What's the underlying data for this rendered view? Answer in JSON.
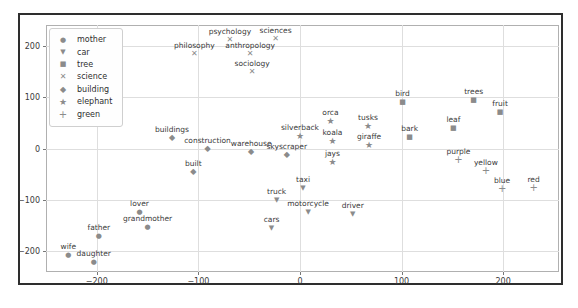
{
  "chart_data": {
    "type": "scatter",
    "title": "",
    "xlabel": "",
    "ylabel": "",
    "xlim": [
      -250,
      255
    ],
    "ylim": [
      -240,
      240
    ],
    "xticks": [
      -200,
      -100,
      0,
      100,
      200
    ],
    "yticks": [
      -200,
      -100,
      0,
      100,
      200
    ],
    "grid": true,
    "legend_position": "upper-left",
    "colors": {
      "marker": "#8b8b8b",
      "point_label": "#3a3a3a",
      "grid": "#dedede",
      "spine": "#b0b0b0",
      "tick_text": "#3a3a3a",
      "outer_frame": "#2e2e2e",
      "background": "#ffffff"
    },
    "series": [
      {
        "name": "mother",
        "marker": "circle",
        "points": [
          {
            "label": "lover",
            "x": -158,
            "y": -123
          },
          {
            "label": "grandmother",
            "x": -150,
            "y": -153
          },
          {
            "label": "father",
            "x": -198,
            "y": -171
          },
          {
            "label": "wife",
            "x": -228,
            "y": -206
          },
          {
            "label": "daughter",
            "x": -203,
            "y": -221
          }
        ]
      },
      {
        "name": "car",
        "marker": "triangle-down",
        "points": [
          {
            "label": "truck",
            "x": -23,
            "y": -100
          },
          {
            "label": "taxi",
            "x": 3,
            "y": -77
          },
          {
            "label": "motorcycle",
            "x": 8,
            "y": -123
          },
          {
            "label": "driver",
            "x": 52,
            "y": -127
          },
          {
            "label": "cars",
            "x": -28,
            "y": -154
          }
        ]
      },
      {
        "name": "tree",
        "marker": "square",
        "points": [
          {
            "label": "bird",
            "x": 101,
            "y": 91
          },
          {
            "label": "trees",
            "x": 171,
            "y": 95
          },
          {
            "label": "fruit",
            "x": 197,
            "y": 70
          },
          {
            "label": "leaf",
            "x": 151,
            "y": 39
          },
          {
            "label": "bark",
            "x": 108,
            "y": 23
          }
        ]
      },
      {
        "name": "science",
        "marker": "x",
        "points": [
          {
            "label": "philosophy",
            "x": -104,
            "y": 183
          },
          {
            "label": "psychology",
            "x": -69,
            "y": 210
          },
          {
            "label": "sciences",
            "x": -24,
            "y": 213
          },
          {
            "label": "anthropology",
            "x": -49,
            "y": 184
          },
          {
            "label": "sociology",
            "x": -47,
            "y": 149
          }
        ]
      },
      {
        "name": "building",
        "marker": "diamond",
        "points": [
          {
            "label": "buildings",
            "x": -126,
            "y": 21
          },
          {
            "label": "construction",
            "x": -91,
            "y": 0
          },
          {
            "label": "warehouse",
            "x": -48,
            "y": -6
          },
          {
            "label": "skyscraper",
            "x": -13,
            "y": -13
          },
          {
            "label": "built",
            "x": -105,
            "y": -46
          }
        ]
      },
      {
        "name": "elephant",
        "marker": "star",
        "points": [
          {
            "label": "silverback",
            "x": 0,
            "y": 25
          },
          {
            "label": "orca",
            "x": 30,
            "y": 54
          },
          {
            "label": "tusks",
            "x": 67,
            "y": 44
          },
          {
            "label": "koala",
            "x": 32,
            "y": 15
          },
          {
            "label": "giraffe",
            "x": 68,
            "y": 6
          },
          {
            "label": "jays",
            "x": 32,
            "y": -27
          }
        ]
      },
      {
        "name": "green",
        "marker": "plus",
        "points": [
          {
            "label": "purple",
            "x": 156,
            "y": -23
          },
          {
            "label": "yellow",
            "x": 183,
            "y": -44
          },
          {
            "label": "blue",
            "x": 199,
            "y": -79
          },
          {
            "label": "red",
            "x": 230,
            "y": -77
          }
        ]
      }
    ]
  }
}
